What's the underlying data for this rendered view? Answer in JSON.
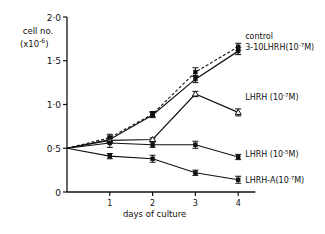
{
  "chart_data": {
    "type": "line",
    "title": "",
    "xlabel": "days of culture",
    "ylabel": "cell no. (x10^-6)",
    "ylabel_line1": "cell no.",
    "ylabel_line2": "(x10",
    "ylabel_exp": "-6",
    "ylabel_close": ")",
    "xlim": [
      0,
      4.5
    ],
    "ylim": [
      0,
      2.0
    ],
    "x_ticks": [
      "1",
      "2",
      "3",
      "4"
    ],
    "y_ticks": [
      "0",
      "0·5",
      "1·0",
      "1·5",
      "2·0"
    ],
    "grid": false,
    "x": [
      0,
      1,
      2,
      3,
      4
    ],
    "series": [
      {
        "name": "control",
        "label": "control",
        "values": [
          0.5,
          0.62,
          0.89,
          1.37,
          1.66
        ],
        "errors": [
          0,
          0.04,
          0.03,
          0.05,
          0.04
        ],
        "style": "dashed",
        "marker": "filled"
      },
      {
        "name": "3-10 LHRH (10^-7 M)",
        "label": "3-10LHRH(10",
        "exp": "-7",
        "suffix": "M)",
        "values": [
          0.5,
          0.6,
          0.88,
          1.29,
          1.61
        ],
        "errors": [
          0,
          0.04,
          0.03,
          0.04,
          0.04
        ],
        "style": "solid",
        "marker": "filled"
      },
      {
        "name": "LHRH (10^-7 M)",
        "label": "LHRH (10",
        "exp": "-7",
        "suffix": "M)",
        "values": [
          0.5,
          0.59,
          0.6,
          1.12,
          0.91
        ],
        "errors": [
          0,
          0.03,
          0.02,
          0.03,
          0.04
        ],
        "style": "solid",
        "marker": "open"
      },
      {
        "name": "LHRH (10^-5 M)",
        "label": "LHRH (10",
        "exp": "-5",
        "suffix": "M)",
        "values": [
          0.5,
          0.56,
          0.54,
          0.54,
          0.4
        ],
        "errors": [
          0,
          0.05,
          0.03,
          0.04,
          0.03
        ],
        "style": "solid",
        "marker": "filled"
      },
      {
        "name": "LHRH-A (10^-7 M)",
        "label": "LHRH-A(10",
        "exp": "-7",
        "suffix": "M)",
        "values": [
          0.5,
          0.41,
          0.38,
          0.22,
          0.14
        ],
        "errors": [
          0,
          0.03,
          0.04,
          0.03,
          0.04
        ],
        "style": "solid",
        "marker": "filled"
      }
    ],
    "legend_position": "right, inline at line ends"
  }
}
